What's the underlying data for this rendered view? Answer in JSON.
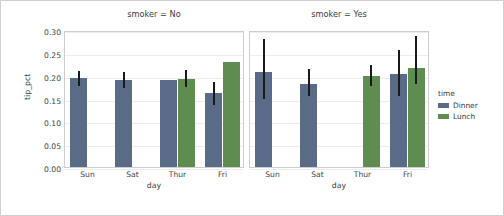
{
  "chart_data": {
    "type": "bar",
    "title": "",
    "xlabel": "day",
    "ylabel": "tip_pct",
    "ylim": [
      0.0,
      0.3
    ],
    "yticks": [
      "0.00",
      "0.05",
      "0.10",
      "0.15",
      "0.20",
      "0.25",
      "0.30"
    ],
    "ytick_values": [
      0.0,
      0.05,
      0.1,
      0.15,
      0.2,
      0.25,
      0.3
    ],
    "categories": [
      "Sun",
      "Sat",
      "Thur",
      "Fri"
    ],
    "grid": "horizontal",
    "legend": {
      "title": "time",
      "position": "right",
      "entries": [
        {
          "label": "Dinner",
          "color": "#5a6b88"
        },
        {
          "label": "Lunch",
          "color": "#5f8c4f"
        }
      ]
    },
    "facets": [
      {
        "title": "smoker = No",
        "series": [
          {
            "name": "Dinner",
            "color": "#5a6b88",
            "values": [
              0.194,
              0.191,
              0.19,
              0.162
            ],
            "err_low": [
              0.177,
              0.174,
              0.19,
              0.136
            ],
            "err_high": [
              0.21,
              0.208,
              0.19,
              0.186
            ]
          },
          {
            "name": "Lunch",
            "color": "#5f8c4f",
            "values": [
              null,
              null,
              0.193,
              0.229
            ],
            "err_low": [
              null,
              null,
              0.176,
              0.229
            ],
            "err_high": [
              null,
              null,
              0.212,
              0.229
            ]
          }
        ]
      },
      {
        "title": "smoker = Yes",
        "series": [
          {
            "name": "Dinner",
            "color": "#5a6b88",
            "values": [
              0.207,
              0.182,
              null,
              0.203
            ],
            "err_low": [
              0.148,
              0.155,
              null,
              0.155
            ],
            "err_high": [
              0.281,
              0.215,
              null,
              0.256
            ]
          },
          {
            "name": "Lunch",
            "color": "#5f8c4f",
            "values": [
              null,
              null,
              0.199,
              0.217
            ],
            "err_low": [
              null,
              null,
              0.178,
              0.182
            ],
            "err_high": [
              null,
              null,
              0.223,
              0.286
            ]
          }
        ]
      }
    ]
  }
}
